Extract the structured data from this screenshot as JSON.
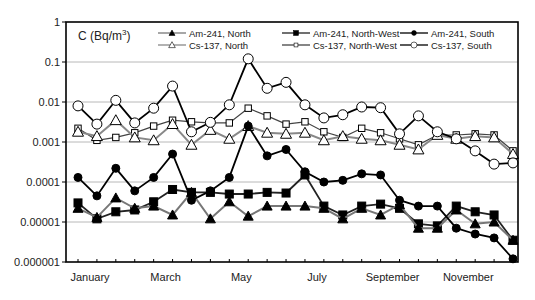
{
  "chart_data": {
    "type": "line",
    "title": "",
    "ylabel": "C (Bq/m3)",
    "ylabel_main": "C (Bq/m",
    "ylabel_sup": "3",
    "ylabel_close": ")",
    "xlabel": "",
    "yscale": "log",
    "ylim": [
      1e-06,
      1
    ],
    "grid": true,
    "legend_position": "top, inside plot, two rows of three entries",
    "y_ticks": [
      "1",
      "0.1",
      "0.01",
      "0.001",
      "0.0001",
      "0.00001",
      "0.000001"
    ],
    "x_tick_labels": [
      "January",
      "March",
      "May",
      "July",
      "September",
      "November"
    ],
    "x": [
      1,
      2,
      3,
      4,
      5,
      6,
      7,
      8,
      9,
      10,
      11,
      12,
      13,
      14,
      15,
      16,
      17,
      18,
      19,
      20,
      21,
      22,
      23,
      24
    ],
    "x_note": "approximately semi-monthly sampling, January through December",
    "series": [
      {
        "name": "Am-241, North",
        "marker": "filled-triangle",
        "line_color": "#777777",
        "values": [
          2.2e-05,
          1.3e-05,
          4e-05,
          2.2e-05,
          2.5e-05,
          1.5e-05,
          5.5e-05,
          1.2e-05,
          3.2e-05,
          1.4e-05,
          2.5e-05,
          2.5e-05,
          2.5e-05,
          2.2e-05,
          1.2e-05,
          2.2e-05,
          1.5e-05,
          2.7e-05,
          7e-06,
          7e-06,
          2e-05,
          9e-06,
          1e-05,
          3.5e-06
        ]
      },
      {
        "name": "Am-241, North-West",
        "marker": "filled-square",
        "line_color": "#222222",
        "values": [
          3e-05,
          1.2e-05,
          1.8e-05,
          2e-05,
          3.2e-05,
          6.5e-05,
          5.5e-05,
          5.5e-05,
          5e-05,
          5e-05,
          5.5e-05,
          5.3e-05,
          0.00015,
          2.5e-05,
          1.5e-05,
          2.5e-05,
          2.8e-05,
          2.2e-05,
          9e-06,
          8e-06,
          2.5e-05,
          1.8e-05,
          1.5e-05,
          3.5e-06
        ]
      },
      {
        "name": "Am-241, South",
        "marker": "filled-circle",
        "line_color": "#000000",
        "values": [
          0.00013,
          4.5e-05,
          0.00022,
          6e-05,
          0.00013,
          0.0005,
          3.5e-05,
          6e-05,
          0.00013,
          0.0025,
          0.00045,
          0.00065,
          0.00018,
          0.0001,
          0.00011,
          0.00016,
          0.00015,
          3.5e-05,
          2.5e-05,
          2.5e-05,
          7e-06,
          5e-06,
          4e-06,
          1.2e-06
        ]
      },
      {
        "name": "Cs-137, North",
        "marker": "open-triangle",
        "line_color": "#888888",
        "values": [
          0.0018,
          0.0014,
          0.0035,
          0.0013,
          0.0011,
          0.0028,
          0.00085,
          0.002,
          0.0012,
          0.0025,
          0.0017,
          0.0016,
          0.0017,
          0.0011,
          0.0014,
          0.0012,
          0.0011,
          0.00085,
          0.00065,
          0.0015,
          0.0012,
          0.0014,
          0.0013,
          0.0005
        ]
      },
      {
        "name": "Cs-137, North-West",
        "marker": "open-square",
        "line_color": "#444444",
        "values": [
          0.0022,
          0.0011,
          0.0013,
          0.0017,
          0.0025,
          0.0035,
          0.0032,
          0.003,
          0.003,
          0.007,
          0.0045,
          0.0028,
          0.0032,
          0.0018,
          0.0013,
          0.0022,
          0.0017,
          0.0012,
          0.00085,
          0.0015,
          0.0015,
          0.0016,
          0.0015,
          0.0006
        ]
      },
      {
        "name": "Cs-137, South",
        "marker": "open-circle",
        "line_color": "#000000",
        "values": [
          0.008,
          0.0028,
          0.011,
          0.003,
          0.007,
          0.025,
          0.0018,
          0.0031,
          0.0085,
          0.12,
          0.022,
          0.031,
          0.0085,
          0.004,
          0.0048,
          0.0075,
          0.0072,
          0.0016,
          0.0045,
          0.0018,
          0.0012,
          0.0006,
          0.00028,
          0.0003
        ]
      }
    ]
  },
  "legend": {
    "items": [
      {
        "label": "Am-241, North"
      },
      {
        "label": "Am-241, North-West"
      },
      {
        "label": "Am-241, South"
      },
      {
        "label": "Cs-137, North"
      },
      {
        "label": "Cs-137, North-West"
      },
      {
        "label": "Cs-137, South"
      }
    ]
  }
}
